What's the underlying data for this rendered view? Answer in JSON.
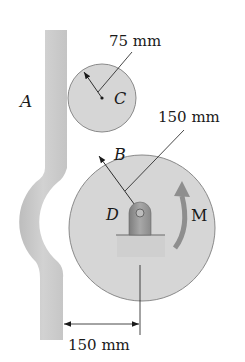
{
  "figure": {
    "labels": {
      "bar": "A",
      "contact": "B",
      "small_center": "C",
      "pin": "D",
      "moment": "M"
    },
    "dimensions": {
      "small_radius": "75 mm",
      "large_radius": "150 mm",
      "horizontal_offset": "150 mm"
    },
    "colors": {
      "disk_fill": "#d6d6d6",
      "disk_stroke": "#8a8a8a",
      "bar_fill": "#c9c9c9",
      "arrow_fill": "#8e8e8e",
      "support_fill": "#9a9a9a",
      "line": "#1a1a1a"
    }
  }
}
